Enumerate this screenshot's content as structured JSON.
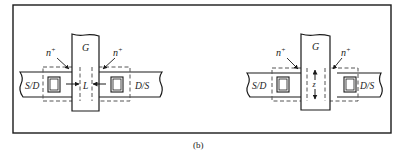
{
  "figure": {
    "caption": "(b)",
    "colors": {
      "stroke": "#1a1a1a",
      "dashed": "#555555",
      "background": "#ffffff"
    },
    "left_device": {
      "gate_label": "G",
      "source_label": "S/D",
      "drain_label": "D/S",
      "implant_label_left": "n",
      "implant_label_right": "n",
      "implant_superscript": "+",
      "dimension_label": "L",
      "dimension_orientation": "horizontal"
    },
    "right_device": {
      "gate_label": "G",
      "source_label": "S/D",
      "drain_label": "D/S",
      "implant_label_left": "n",
      "implant_label_right": "n",
      "implant_superscript": "+",
      "dimension_label": "z",
      "dimension_orientation": "vertical"
    }
  }
}
